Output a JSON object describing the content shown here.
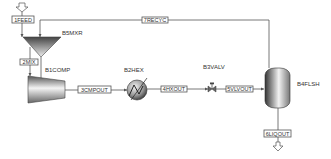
{
  "diagram": {
    "type": "process-flowsheet",
    "blocks": [
      {
        "id": "B5MXR",
        "label": "B5MXR",
        "kind": "mixer"
      },
      {
        "id": "B1COMP",
        "label": "B1COMP",
        "kind": "compressor"
      },
      {
        "id": "B2HEX",
        "label": "B2HEX",
        "kind": "heat-exchanger"
      },
      {
        "id": "B3VALV",
        "label": "B3VALV",
        "kind": "valve"
      },
      {
        "id": "B4FLSH",
        "label": "B4FLSH",
        "kind": "flash-drum"
      }
    ],
    "streams": [
      {
        "id": "1FEED",
        "label": "1FEED",
        "from": "feed",
        "to": "B5MXR"
      },
      {
        "id": "2MIX",
        "label": "2MIX",
        "from": "B5MXR",
        "to": "B1COMP"
      },
      {
        "id": "3CMPOUT",
        "label": "3CMPOUT",
        "from": "B1COMP",
        "to": "B2HEX"
      },
      {
        "id": "4HXOUT",
        "label": "4HXOUT",
        "from": "B2HEX",
        "to": "B3VALV"
      },
      {
        "id": "5VLVOUT",
        "label": "5VLVOUT",
        "from": "B3VALV",
        "to": "B4FLSH"
      },
      {
        "id": "6LIQOUT",
        "label": "6LIQOUT",
        "from": "B4FLSH",
        "to": "product"
      },
      {
        "id": "7RECYC",
        "label": "7RECYC",
        "from": "B4FLSH",
        "to": "B5MXR"
      }
    ]
  }
}
